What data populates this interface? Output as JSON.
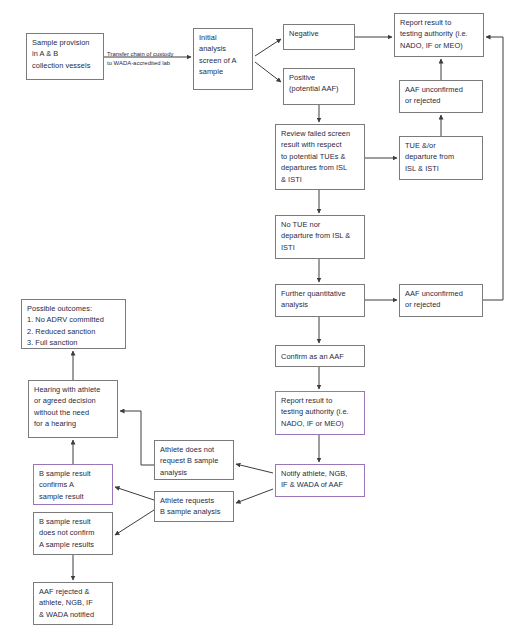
{
  "diagram": {
    "colors": {
      "box_border": "#7b7b7b",
      "accent_border": "#9a76b8",
      "text": "#1f2a44",
      "edge": "#3d3d3d",
      "background": "#ffffff"
    },
    "nodes": [
      {
        "id": "sample-provision",
        "label": "Sample provision\nin A & B\ncollection vessels",
        "x": 26,
        "y": 33,
        "w": 78,
        "h": 47,
        "accent": false
      },
      {
        "id": "initial-analysis",
        "label": "Initial\nanalysis\nscreen of A\nsample",
        "x": 193,
        "y": 28,
        "w": 60,
        "h": 62,
        "accent": false
      },
      {
        "id": "negative",
        "label": "Negative",
        "x": 283,
        "y": 24,
        "w": 72,
        "h": 26,
        "accent": false
      },
      {
        "id": "positive",
        "label": "Positive\n(potential AAF)",
        "x": 283,
        "y": 68,
        "w": 72,
        "h": 37,
        "accent": false
      },
      {
        "id": "report-result-top",
        "label": "Report result to\ntesting authority (i.e.\nNADO, IF or MEO)",
        "x": 394,
        "y": 13,
        "w": 90,
        "h": 44,
        "accent": false
      },
      {
        "id": "aaf-unconfirmed-top",
        "label": "AAF unconfirmed\nor rejected",
        "x": 399,
        "y": 80,
        "w": 84,
        "h": 33,
        "accent": false
      },
      {
        "id": "review-failed-screen",
        "label": "Review failed screen\nresult with respect\nto potential TUEs &\ndepartures from ISL\n& ISTI",
        "x": 275,
        "y": 124,
        "w": 90,
        "h": 66,
        "accent": false
      },
      {
        "id": "tue-departure",
        "label": "TUE &/or\ndeparture from\nISL & ISTI",
        "x": 399,
        "y": 136,
        "w": 84,
        "h": 44,
        "accent": false
      },
      {
        "id": "no-tue-no-departure",
        "label": "No TUE nor\ndeparture from ISL &\nISTI",
        "x": 275,
        "y": 215,
        "w": 90,
        "h": 44,
        "accent": false
      },
      {
        "id": "further-quantitative",
        "label": "Further quantitative\nanalysis",
        "x": 275,
        "y": 284,
        "w": 90,
        "h": 33,
        "accent": false
      },
      {
        "id": "aaf-unconfirmed-lower",
        "label": "AAF unconfirmed\nor rejected",
        "x": 399,
        "y": 284,
        "w": 84,
        "h": 33,
        "accent": false
      },
      {
        "id": "confirm-aaf",
        "label": "Confirm as an AAF",
        "x": 275,
        "y": 345,
        "w": 90,
        "h": 22,
        "accent": false
      },
      {
        "id": "report-result-lower",
        "label": "Report result to\ntesting authority (i.e.\nNADO, IF or MEO)",
        "x": 275,
        "y": 391,
        "w": 90,
        "h": 44,
        "accent": true
      },
      {
        "id": "notify-athlete",
        "label": "Notify athlete, NGB,\nIF & WADA of AAF",
        "x": 275,
        "y": 464,
        "w": 90,
        "h": 33,
        "accent": true
      },
      {
        "id": "possible-outcomes",
        "label": "Possible outcomes:\n1. No ADRV committed\n2. Reduced sanction\n3. Full sanction",
        "x": 21,
        "y": 299,
        "w": 105,
        "h": 50,
        "accent": false
      },
      {
        "id": "hearing-with-athlete",
        "label": "Hearing with athlete\nor agreed decision\nwithout the need\nfor a hearing",
        "x": 28,
        "y": 380,
        "w": 90,
        "h": 58,
        "accent": false
      },
      {
        "id": "athlete-does-not-request",
        "label": "Athlete does not\nrequest B sample\nanalysis",
        "x": 154,
        "y": 440,
        "w": 80,
        "h": 40,
        "accent": false
      },
      {
        "id": "athlete-requests",
        "label": "Athlete requests\nB sample analysis",
        "x": 154,
        "y": 491,
        "w": 80,
        "h": 31,
        "accent": false
      },
      {
        "id": "b-confirms-a",
        "label": "B sample result\nconfirms A\nsample result",
        "x": 33,
        "y": 464,
        "w": 80,
        "h": 41,
        "accent": true
      },
      {
        "id": "b-does-not-confirm",
        "label": "B sample result\ndoes not confirm\nA sample results",
        "x": 33,
        "y": 512,
        "w": 80,
        "h": 43,
        "accent": false
      },
      {
        "id": "aaf-rejected-notified",
        "label": "AAF rejected &\nathlete, NGB, IF\n& WADA notified",
        "x": 33,
        "y": 582,
        "w": 80,
        "h": 43,
        "accent": false
      }
    ],
    "edge_labels": [
      {
        "id": "transfer-chain-of-custody",
        "text": "Transfer chain of custody\nto WADA-accredited lab",
        "x": 107,
        "y": 50,
        "w": 84
      }
    ]
  }
}
